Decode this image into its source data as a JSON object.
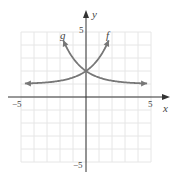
{
  "chart_data": {
    "type": "line",
    "title": "",
    "xlabel": "x",
    "ylabel": "y",
    "xlim": [
      -5,
      5
    ],
    "ylim": [
      -5,
      5
    ],
    "grid": true,
    "tick_labels": {
      "x": [
        "-5",
        "5"
      ],
      "y": [
        "5",
        "-5"
      ]
    },
    "series": [
      {
        "name": "f",
        "formula": "2^x + 1",
        "asymptote": 1,
        "intercept": [
          0,
          2
        ]
      },
      {
        "name": "g",
        "formula": "2^(-x) + 1",
        "asymptote": 1,
        "intercept": [
          0,
          2
        ]
      }
    ]
  },
  "labels": {
    "x_axis": "x",
    "y_axis": "y",
    "x_min": "−5",
    "x_max": "5",
    "y_max": "5",
    "y_min": "−5",
    "f": "f",
    "g": "g"
  },
  "colors": {
    "curve": "#777777",
    "axis": "#333333",
    "grid": "#e6e6e6"
  }
}
